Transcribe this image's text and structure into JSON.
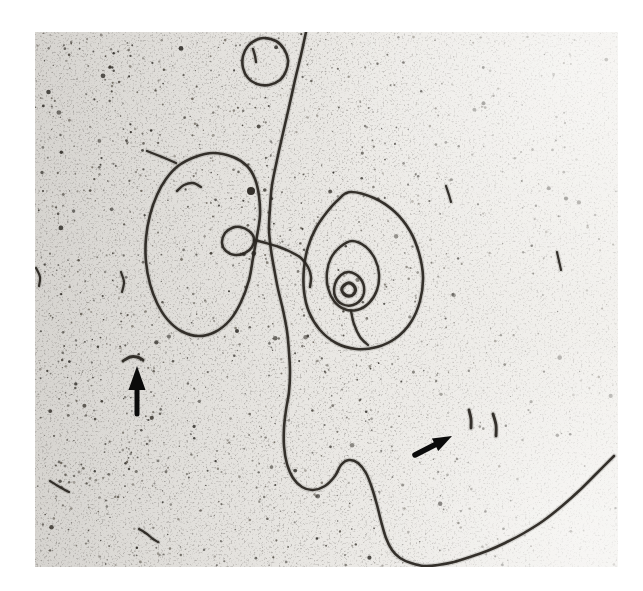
{
  "figure": {
    "type": "electron micrograph",
    "background_color": "#eae8e4",
    "strand_color": "#2b2722",
    "annotation_color": "#0b0b0b",
    "frame": {
      "left": 35,
      "top": 32,
      "width": 583,
      "height": 535
    }
  },
  "annotations": {
    "left_arrow": {
      "label": "left arrow marker",
      "direction": "up",
      "points_to": "short DNA fragment"
    },
    "right_arrow": {
      "label": "right arrow marker",
      "direction": "up-right",
      "points_to": "two short DNA fragments"
    }
  },
  "geometry": {
    "strands": [
      {
        "name": "dna-long-strand",
        "closed": false,
        "w": 2.6,
        "points": [
          [
            306,
            32
          ],
          [
            301,
            55
          ],
          [
            295,
            80
          ],
          [
            289,
            107
          ],
          [
            283,
            133
          ],
          [
            277,
            160
          ],
          [
            272,
            185
          ],
          [
            270,
            208
          ],
          [
            269,
            230
          ],
          [
            271,
            250
          ],
          [
            274,
            268
          ],
          [
            278,
            289
          ],
          [
            283,
            310
          ],
          [
            287,
            331
          ],
          [
            289,
            352
          ],
          [
            290,
            372
          ],
          [
            289,
            392
          ],
          [
            286,
            410
          ],
          [
            284,
            428
          ],
          [
            284,
            446
          ],
          [
            287,
            464
          ],
          [
            293,
            478
          ],
          [
            302,
            487
          ],
          [
            313,
            490
          ],
          [
            325,
            486
          ],
          [
            335,
            476
          ],
          [
            341,
            465
          ],
          [
            349,
            460
          ],
          [
            358,
            463
          ],
          [
            366,
            473
          ],
          [
            372,
            488
          ],
          [
            377,
            505
          ],
          [
            381,
            521
          ],
          [
            386,
            538
          ],
          [
            392,
            550
          ],
          [
            400,
            558
          ],
          [
            411,
            563
          ],
          [
            424,
            566
          ],
          [
            438,
            565
          ],
          [
            454,
            562
          ],
          [
            470,
            557
          ],
          [
            487,
            551
          ],
          [
            505,
            543
          ],
          [
            524,
            533
          ],
          [
            543,
            521
          ],
          [
            562,
            506
          ],
          [
            581,
            489
          ],
          [
            598,
            472
          ],
          [
            614,
            456
          ]
        ]
      },
      {
        "name": "dna-left-loop",
        "closed": true,
        "w": 2.6,
        "points": [
          [
            213,
            153
          ],
          [
            233,
            157
          ],
          [
            247,
            166
          ],
          [
            255,
            179
          ],
          [
            259,
            196
          ],
          [
            260,
            215
          ],
          [
            257,
            236
          ],
          [
            253,
            258
          ],
          [
            249,
            280
          ],
          [
            241,
            302
          ],
          [
            230,
            320
          ],
          [
            215,
            332
          ],
          [
            198,
            336
          ],
          [
            181,
            331
          ],
          [
            167,
            319
          ],
          [
            157,
            303
          ],
          [
            150,
            284
          ],
          [
            146,
            262
          ],
          [
            146,
            238
          ],
          [
            150,
            215
          ],
          [
            157,
            195
          ],
          [
            166,
            179
          ],
          [
            178,
            166
          ],
          [
            195,
            157
          ]
        ]
      },
      {
        "name": "dna-knot-loop",
        "closed": true,
        "w": 2.5,
        "points": [
          [
            240,
            227
          ],
          [
            249,
            231
          ],
          [
            254,
            238
          ],
          [
            252,
            247
          ],
          [
            245,
            253
          ],
          [
            235,
            255
          ],
          [
            226,
            251
          ],
          [
            222,
            243
          ],
          [
            225,
            233
          ],
          [
            232,
            228
          ]
        ]
      },
      {
        "name": "dna-connector-strand",
        "closed": false,
        "w": 2.5,
        "points": [
          [
            254,
            240
          ],
          [
            266,
            243
          ],
          [
            279,
            247
          ],
          [
            291,
            252
          ],
          [
            301,
            258
          ],
          [
            308,
            267
          ],
          [
            311,
            277
          ],
          [
            310,
            287
          ]
        ]
      },
      {
        "name": "dna-spiral-outer-ring",
        "closed": true,
        "w": 2.6,
        "points": [
          [
            350,
            192
          ],
          [
            374,
            198
          ],
          [
            395,
            212
          ],
          [
            410,
            231
          ],
          [
            419,
            253
          ],
          [
            423,
            277
          ],
          [
            420,
            301
          ],
          [
            411,
            322
          ],
          [
            396,
            338
          ],
          [
            377,
            347
          ],
          [
            356,
            349
          ],
          [
            336,
            343
          ],
          [
            320,
            330
          ],
          [
            309,
            312
          ],
          [
            304,
            291
          ],
          [
            304,
            268
          ],
          [
            308,
            247
          ],
          [
            316,
            228
          ],
          [
            327,
            212
          ],
          [
            338,
            200
          ]
        ]
      },
      {
        "name": "dna-spiral-middle-ring",
        "closed": true,
        "w": 2.5,
        "points": [
          [
            352,
            241
          ],
          [
            366,
            247
          ],
          [
            375,
            259
          ],
          [
            379,
            274
          ],
          [
            377,
            290
          ],
          [
            369,
            303
          ],
          [
            357,
            310
          ],
          [
            344,
            309
          ],
          [
            334,
            301
          ],
          [
            328,
            288
          ],
          [
            327,
            272
          ],
          [
            331,
            258
          ],
          [
            340,
            247
          ]
        ]
      },
      {
        "name": "dna-spiral-inner-ring",
        "closed": true,
        "w": 2.5,
        "points": [
          [
            349,
            272
          ],
          [
            359,
            277
          ],
          [
            364,
            287
          ],
          [
            362,
            298
          ],
          [
            353,
            305
          ],
          [
            342,
            304
          ],
          [
            335,
            296
          ],
          [
            335,
            284
          ],
          [
            341,
            275
          ]
        ]
      },
      {
        "name": "dna-spiral-center-loop",
        "closed": true,
        "w": 3.2,
        "points": [
          [
            348,
            283
          ],
          [
            354,
            286
          ],
          [
            355,
            292
          ],
          [
            350,
            296
          ],
          [
            344,
            294
          ],
          [
            342,
            288
          ]
        ]
      },
      {
        "name": "dna-spiral-stem",
        "closed": false,
        "w": 2.4,
        "points": [
          [
            351,
            311
          ],
          [
            354,
            324
          ],
          [
            360,
            337
          ],
          [
            368,
            345
          ]
        ]
      },
      {
        "name": "dna-minicircle",
        "closed": true,
        "w": 2.6,
        "points": [
          [
            264,
            38
          ],
          [
            276,
            41
          ],
          [
            284,
            49
          ],
          [
            288,
            60
          ],
          [
            286,
            71
          ],
          [
            280,
            80
          ],
          [
            269,
            85
          ],
          [
            257,
            84
          ],
          [
            248,
            78
          ],
          [
            243,
            68
          ],
          [
            243,
            56
          ],
          [
            248,
            46
          ],
          [
            256,
            40
          ]
        ]
      },
      {
        "name": "fragment-inside-loop",
        "closed": false,
        "w": 2.4,
        "points": [
          [
            177,
            191
          ],
          [
            184,
            185
          ],
          [
            193,
            183
          ],
          [
            201,
            187
          ]
        ]
      },
      {
        "name": "fragment-northwest-of-loop",
        "closed": false,
        "w": 2.3,
        "points": [
          [
            147,
            151
          ],
          [
            157,
            155
          ],
          [
            167,
            159
          ],
          [
            176,
            163
          ]
        ]
      },
      {
        "name": "fragment-left-edge",
        "closed": false,
        "w": 2.2,
        "points": [
          [
            121,
            272
          ],
          [
            124,
            282
          ],
          [
            122,
            292
          ]
        ]
      },
      {
        "name": "fragment-left-arrow-target",
        "closed": false,
        "w": 2.9,
        "points": [
          [
            123,
            361
          ],
          [
            130,
            357
          ],
          [
            137,
            357
          ],
          [
            143,
            360
          ]
        ]
      },
      {
        "name": "fragment-right-arrow-target-1",
        "closed": false,
        "w": 2.9,
        "points": [
          [
            469,
            410
          ],
          [
            471,
            419
          ],
          [
            471,
            428
          ]
        ]
      },
      {
        "name": "fragment-right-arrow-target-2",
        "closed": false,
        "w": 2.9,
        "points": [
          [
            493,
            414
          ],
          [
            496,
            425
          ],
          [
            496,
            436
          ]
        ]
      },
      {
        "name": "fragment-bottom-left-1",
        "closed": false,
        "w": 2.2,
        "points": [
          [
            50,
            481
          ],
          [
            58,
            486
          ],
          [
            65,
            490
          ],
          [
            69,
            492
          ]
        ]
      },
      {
        "name": "fragment-bottom-left-2",
        "closed": false,
        "w": 2.2,
        "points": [
          [
            139,
            529
          ],
          [
            147,
            534
          ],
          [
            153,
            539
          ],
          [
            158,
            542
          ]
        ]
      },
      {
        "name": "fragment-right-field-1",
        "closed": false,
        "w": 2.2,
        "points": [
          [
            557,
            252
          ],
          [
            559,
            261
          ],
          [
            561,
            270
          ]
        ]
      },
      {
        "name": "fragment-right-field-2",
        "closed": false,
        "w": 2.2,
        "points": [
          [
            446,
            186
          ],
          [
            449,
            195
          ],
          [
            451,
            202
          ]
        ]
      },
      {
        "name": "fragment-inside-minicircle",
        "closed": false,
        "w": 2.4,
        "points": [
          [
            253,
            49
          ],
          [
            255,
            56
          ],
          [
            256,
            62
          ]
        ]
      },
      {
        "name": "fragment-photo-left-margin",
        "closed": false,
        "w": 2.2,
        "points": [
          [
            36,
            268
          ],
          [
            40,
            277
          ],
          [
            39,
            286
          ]
        ]
      }
    ],
    "dots": [
      {
        "name": "dense-particle-dot",
        "x": 251,
        "y": 191,
        "r": 4
      }
    ],
    "arrows": [
      {
        "name": "left-arrow",
        "tip": [
          137,
          366
        ],
        "tail": [
          137,
          414
        ],
        "head_len": 24,
        "head_w": 17,
        "shaft_w": 5
      },
      {
        "name": "right-arrow",
        "tip": [
          452,
          436
        ],
        "tail": [
          415,
          455
        ],
        "head_len": 19,
        "head_w": 14,
        "shaft_w": 5.5
      }
    ]
  }
}
